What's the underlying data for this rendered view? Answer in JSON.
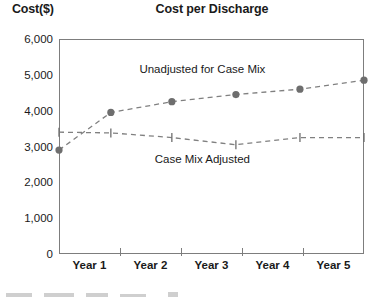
{
  "chart_data": {
    "type": "line",
    "title": "Cost per Discharge",
    "ylabel": "Cost($)",
    "xlabel": "",
    "categories": [
      "Year 1",
      "Year 2",
      "Year 3",
      "Year 4",
      "Year 5"
    ],
    "yticks": [
      "0",
      "1,000",
      "2,000",
      "3,000",
      "4,000",
      "5,000",
      "6,000"
    ],
    "ytick_values": [
      0,
      1000,
      2000,
      3000,
      4000,
      5000,
      6000
    ],
    "ylim": [
      0,
      6000
    ],
    "xlim": [
      0,
      5
    ],
    "grid": false,
    "legend_position": "inline-annotation",
    "series": [
      {
        "name": "Unadjusted for Case Mix",
        "marker": "circle",
        "linestyle": "dashed",
        "color": "#808080",
        "x": [
          0.0,
          0.85,
          1.85,
          2.9,
          3.95,
          5.0
        ],
        "values": [
          2900,
          3950,
          4250,
          4450,
          4600,
          4850
        ]
      },
      {
        "name": "Case Mix Adjusted",
        "marker": "vertical-tick",
        "linestyle": "dashed",
        "color": "#808080",
        "x": [
          0.0,
          0.85,
          1.85,
          2.9,
          3.95,
          5.0
        ],
        "values": [
          3400,
          3380,
          3250,
          3050,
          3250,
          3250
        ]
      }
    ],
    "annotations": [
      {
        "text": "Unadjusted for Case Mix",
        "x": 2.35,
        "y": 5100
      },
      {
        "text": "Case Mix Adjusted",
        "x": 2.35,
        "y": 2600
      }
    ]
  },
  "colors": {
    "axis": "#7d7d7d",
    "text": "#1a1a1a",
    "series": "#808080",
    "marker": "#6e6e6e",
    "background": "#ffffff"
  }
}
